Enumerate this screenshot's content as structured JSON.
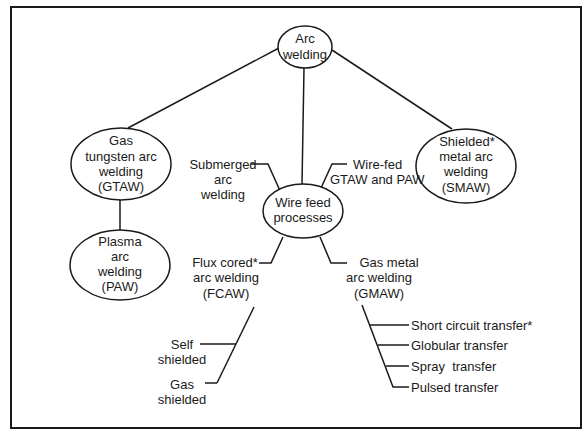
{
  "diagram": {
    "root": {
      "lines": [
        "Arc",
        "welding"
      ]
    },
    "gtaw": {
      "lines": [
        "Gas",
        "tungsten arc",
        "welding",
        "(GTAW)"
      ]
    },
    "paw": {
      "lines": [
        "Plasma",
        "arc",
        "welding",
        "(PAW)"
      ]
    },
    "smaw": {
      "lines": [
        "Shielded*",
        "metal arc",
        "welding",
        "(SMAW)"
      ]
    },
    "wire_feed": {
      "lines": [
        "Wire feed",
        "processes"
      ]
    },
    "submerged": {
      "lines": [
        "Submerged",
        "arc",
        "welding"
      ]
    },
    "wire_fed_gtaw_paw": {
      "lines": [
        "Wire-fed",
        "GTAW and PAW"
      ]
    },
    "fcaw": {
      "lines": [
        "Flux cored*",
        "arc welding",
        "(FCAW)"
      ],
      "children": [
        {
          "lines": [
            "Self",
            "shielded"
          ]
        },
        {
          "lines": [
            "Gas",
            "shielded"
          ]
        }
      ]
    },
    "gmaw": {
      "lines": [
        "Gas metal",
        "arc welding",
        "(GMAW)"
      ],
      "children": [
        {
          "label": "Short circuit transfer*"
        },
        {
          "label": "Globular transfer"
        },
        {
          "label": "Spray  transfer"
        },
        {
          "label": "Pulsed transfer"
        }
      ]
    }
  }
}
